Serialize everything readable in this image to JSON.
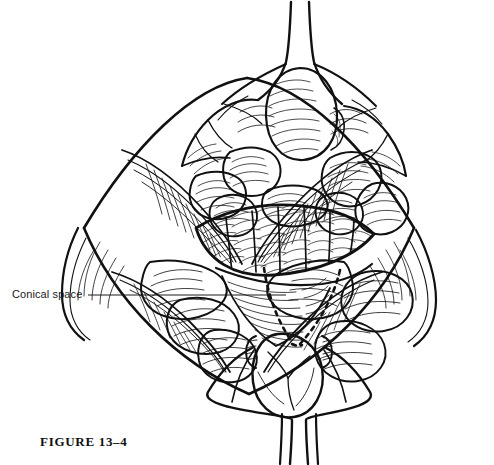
{
  "figure": {
    "caption": "FIGURE 13–4",
    "domain_subject": "surgical anatomy line illustration",
    "background_color": "#ffffff",
    "ink_color": "#111111",
    "width": 494,
    "height": 465
  },
  "annotations": [
    {
      "id": "conical-space",
      "label": "Conical space",
      "leader_line": {
        "x1": 88,
        "y1": 295,
        "x2": 286,
        "y2": 295,
        "color": "#1a1a1a",
        "width": 1
      }
    }
  ],
  "illustration": {
    "style": "pen-and-ink hatched medical drawing",
    "line_color": "#111111",
    "fill_color": "#ffffff",
    "regions": [
      {
        "name": "superior-stalk",
        "description": "narrow vertical tube at top center flaring into the field"
      },
      {
        "name": "superior-lobular-mass",
        "description": "rounded hatched lobe below the superior stalk"
      },
      {
        "name": "upper-fat-lobules",
        "description": "cluster of lobulated fat bodies filling upper field"
      },
      {
        "name": "central-ridged-muscle",
        "description": "transverse banded striated muscle belly across mid field"
      },
      {
        "name": "conical-space-outline",
        "description": "dashed inverted triangle marking the conical space"
      },
      {
        "name": "lower-fat-lobules",
        "description": "cloud-like fat lobules of lower field"
      },
      {
        "name": "inferior-mass",
        "description": "rounded bulbous mass at bottom center with banded collars"
      },
      {
        "name": "inferior-stalk",
        "description": "narrow vertical tube exiting at bottom center"
      },
      {
        "name": "left-retracted-flap",
        "description": "left lateral tissue wing with fine radiating hatching"
      },
      {
        "name": "right-retracted-flap",
        "description": "right lateral tissue wing with fine radiating hatching"
      }
    ]
  }
}
